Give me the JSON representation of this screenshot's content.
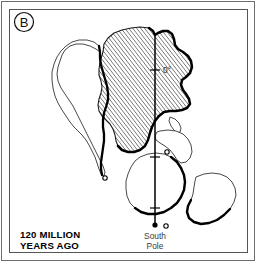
{
  "figure": {
    "panel_letter": "B",
    "caption_line1": "120 MILLION",
    "caption_line2": "YEARS AGO",
    "meridian_label": "0°",
    "pole_label_line1": "South",
    "pole_label_line2": "Pole",
    "colors": {
      "background": "#ffffff",
      "frame_line": "#555555",
      "outline_thin": "#333333",
      "outline_thick": "#000000",
      "hatch": "#333333",
      "text": "#000000",
      "pole_text": "#3a3a3a"
    },
    "landmasses": [
      {
        "name": "africa",
        "label": "Africa",
        "filled": "hatched",
        "path": "M 103 52 L 104 44 L 108 38 L 114 33 L 122 30 L 131 28 L 140 27 L 149 28 L 153 31 L 155 35 L 158 33 L 163 31 L 168 31 L 172 34 L 174 39 L 175 45 L 178 49 L 183 52 L 188 56 L 191 61 L 192 67 L 190 73 L 186 77 L 182 80 L 181 85 L 183 90 L 186 94 L 189 99 L 190 104 L 187 108 L 182 110 L 176 111 L 170 111 L 164 112 L 159 116 L 155 121 L 152 127 L 150 133 L 148 140 L 145 146 L 140 150 L 134 152 L 128 152 L 122 150 L 118 146 L 116 141 L 115 135 L 113 129 L 110 124 L 106 120 L 102 116 L 99 111 L 98 105 L 99 99 L 101 93 L 102 87 L 101 81 L 99 75 L 99 69 L 100 62 L 103 52 Z"
      },
      {
        "name": "south-america",
        "label": "South America",
        "filled": "none",
        "path": "M 100 52 L 96 49 L 90 46 L 83 44 L 76 44 L 70 46 L 65 50 L 62 55 L 60 61 L 58 67 L 57 74 L 58 81 L 61 88 L 65 94 L 69 100 L 73 106 L 76 112 L 79 118 L 82 124 L 85 130 L 88 136 L 91 142 L 94 148 L 97 154 L 100 160 L 103 166 L 105 172 L 104 176 L 101 174 L 99 169 L 97 163 L 95 157 L 92 151 L 89 145 L 86 140 L 82 135 L 78 131 L 74 127 L 70 122 L 66 116 L 62 110 L 58 103 L 55 96 L 53 88 L 52 80 L 52 72 L 54 64 L 57 57 L 61 51 L 66 46 L 72 42 L 79 40 L 87 40 L 94 42 L 99 46 L 100 52 Z"
      },
      {
        "name": "madagascar",
        "label": "Madagascar",
        "filled": "none",
        "path": "M 170 117 L 175 119 L 179 123 L 181 128 L 180 132 L 177 133 L 174 130 L 171 126 L 169 121 L 170 117 Z"
      },
      {
        "name": "india",
        "label": "India",
        "filled": "none",
        "path": "M 160 131 L 168 130 L 176 131 L 183 134 L 188 139 L 191 145 L 192 152 L 190 158 L 186 162 L 181 163 L 177 160 L 174 155 L 170 150 L 165 146 L 160 143 L 156 140 L 155 136 L 157 132 L 160 131 Z"
      },
      {
        "name": "antarctica",
        "label": "Antarctica",
        "filled": "none",
        "path": "M 140 157 L 148 154 L 156 153 L 164 154 L 171 157 L 177 162 L 181 168 L 184 175 L 185 182 L 184 190 L 181 197 L 177 203 L 171 208 L 164 212 L 156 214 L 148 214 L 141 212 L 135 208 L 130 203 L 127 196 L 126 189 L 126 181 L 128 174 L 131 167 L 135 161 L 140 157 Z"
      },
      {
        "name": "australia",
        "label": "Australia",
        "filled": "none",
        "path": "M 196 177 L 204 174 L 212 173 L 220 174 L 227 177 L 232 182 L 235 188 L 236 195 L 234 202 L 230 209 L 224 215 L 217 220 L 209 223 L 201 224 L 194 222 L 189 218 L 187 212 L 188 206 L 191 200 L 193 194 L 194 187 L 195 181 L 196 177 Z"
      }
    ],
    "markers": [
      {
        "name": "marker-south-america",
        "cx": 105,
        "cy": 178,
        "r": 2.2
      },
      {
        "name": "marker-india",
        "cx": 167,
        "cy": 152,
        "r": 2.2
      },
      {
        "name": "marker-antarctica",
        "cx": 166,
        "cy": 226,
        "r": 2.2
      }
    ],
    "meridian": {
      "x": 155,
      "y_top": 33,
      "y_bottom": 225,
      "ticks": [
        70,
        157,
        208
      ],
      "pole_dot": {
        "cx": 155,
        "cy": 225,
        "r": 2.6
      }
    }
  }
}
